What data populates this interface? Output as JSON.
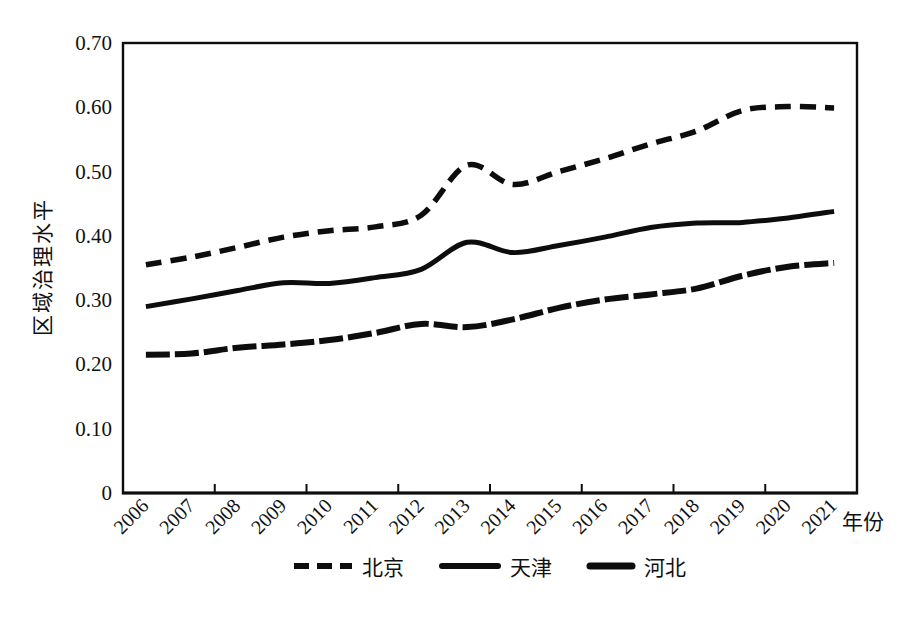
{
  "figure": {
    "background": "#ffffff",
    "text_color": "#111111"
  },
  "chart_data": {
    "type": "line",
    "title": "",
    "xlabel": "年份",
    "ylabel": "区域治理水平",
    "categories": [
      "2006",
      "2007",
      "2008",
      "2009",
      "2010",
      "2011",
      "2012",
      "2013",
      "2014",
      "2015",
      "2016",
      "2017",
      "2018",
      "2019",
      "2020",
      "2021"
    ],
    "ylim": [
      0,
      0.7
    ],
    "ytick_values": [
      0,
      0.1,
      0.2,
      0.3,
      0.4,
      0.5,
      0.6,
      0.7
    ],
    "ytick_labels": [
      "0",
      "0.10",
      "0.20",
      "0.30",
      "0.40",
      "0.50",
      "0.60",
      "0.70"
    ],
    "x_tick_interval": 2,
    "grid": false,
    "legend_position": "bottom",
    "line_color": "#0d0d0d",
    "series": [
      {
        "name": "北京",
        "style": "dashed",
        "values": [
          0.355,
          0.367,
          0.382,
          0.398,
          0.408,
          0.414,
          0.432,
          0.51,
          0.48,
          0.5,
          0.52,
          0.543,
          0.563,
          0.595,
          0.601,
          0.599
        ]
      },
      {
        "name": "天津",
        "style": "solid",
        "values": [
          0.29,
          0.302,
          0.315,
          0.327,
          0.326,
          0.335,
          0.348,
          0.39,
          0.374,
          0.385,
          0.398,
          0.413,
          0.42,
          0.421,
          0.428,
          0.438
        ]
      },
      {
        "name": "河北",
        "style": "dense-dash",
        "values": [
          0.215,
          0.217,
          0.226,
          0.231,
          0.238,
          0.249,
          0.263,
          0.258,
          0.27,
          0.288,
          0.301,
          0.309,
          0.318,
          0.338,
          0.352,
          0.358
        ]
      }
    ]
  }
}
